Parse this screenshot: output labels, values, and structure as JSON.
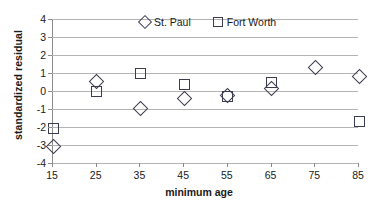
{
  "chart_data": {
    "type": "scatter",
    "title": "",
    "xlabel": "minimum age",
    "ylabel": "standardized residual",
    "xlim": [
      15,
      85
    ],
    "ylim": [
      -4,
      4
    ],
    "xticks": [
      15,
      25,
      35,
      45,
      55,
      65,
      75,
      85
    ],
    "yticks": [
      4,
      3,
      2,
      1,
      0,
      -1,
      -2,
      -3,
      -4
    ],
    "xtick_labels": [
      "15",
      "25",
      "35",
      "45",
      "55",
      "65",
      "75",
      "85"
    ],
    "ytick_labels": [
      "4",
      "3",
      "2",
      "1",
      "0",
      "-1",
      "-2",
      "-3",
      "-4"
    ],
    "grid": "horizontal",
    "legend_position": "top-center",
    "series": [
      {
        "name": "St. Paul",
        "marker": "diamond",
        "color": "#3c3c50",
        "x": [
          15,
          25,
          35,
          45,
          55,
          65,
          75,
          85
        ],
        "values": [
          -3.05,
          0.6,
          -0.9,
          -0.35,
          -0.2,
          0.2,
          1.35,
          0.85
        ]
      },
      {
        "name": "Fort Worth",
        "marker": "square",
        "color": "#3c3c50",
        "x": [
          15,
          25,
          35,
          45,
          55,
          65,
          85
        ],
        "values": [
          -2.0,
          0.05,
          1.05,
          0.4,
          -0.25,
          0.55,
          -1.65
        ]
      }
    ]
  },
  "legend": {
    "items": [
      {
        "label": "St. Paul",
        "marker": "diamond"
      },
      {
        "label": "Fort Worth",
        "marker": "square"
      }
    ]
  }
}
